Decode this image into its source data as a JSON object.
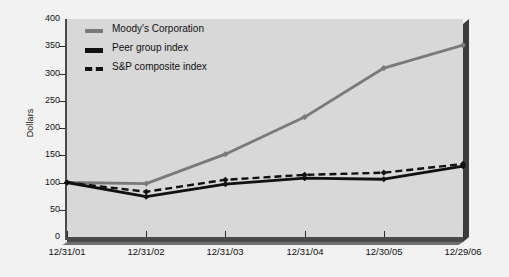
{
  "chart_data": {
    "type": "line",
    "title": "",
    "xlabel": "",
    "ylabel": "Dollars",
    "categories": [
      "12/31/01",
      "12/31/02",
      "12/31/03",
      "12/31/04",
      "12/30/05",
      "12/29/06"
    ],
    "ylim": [
      0,
      400
    ],
    "yticks": [
      0,
      50,
      100,
      150,
      200,
      250,
      300,
      350,
      400
    ],
    "grid": false,
    "legend_position": "top-left-inside",
    "series": [
      {
        "name": "Moody's Corporation",
        "values": [
          100,
          98,
          152,
          220,
          310,
          352
        ],
        "color": "#7a7a7a",
        "style": "solid",
        "marker": "diamond"
      },
      {
        "name": "Peer group index",
        "values": [
          100,
          74,
          97,
          108,
          106,
          130
        ],
        "color": "#111111",
        "style": "solid",
        "marker": "diamond"
      },
      {
        "name": "S&P composite index",
        "values": [
          100,
          83,
          105,
          114,
          118,
          134
        ],
        "color": "#111111",
        "style": "dashed",
        "marker": "diamond"
      }
    ]
  },
  "axis": {
    "y_title": "Dollars",
    "y_tick_labels": [
      "400",
      "350",
      "300",
      "250",
      "200",
      "150",
      "100",
      "50",
      "0"
    ],
    "x_tick_labels": [
      "12/31/01",
      "12/31/02",
      "12/31/03",
      "12/31/04",
      "12/30/05",
      "12/29/06"
    ]
  },
  "legend": {
    "items": [
      {
        "label": "Moody's Corporation",
        "swatch": "moody"
      },
      {
        "label": "Peer group index",
        "swatch": "peer"
      },
      {
        "label": "S&P composite index",
        "swatch": "snp"
      }
    ]
  }
}
